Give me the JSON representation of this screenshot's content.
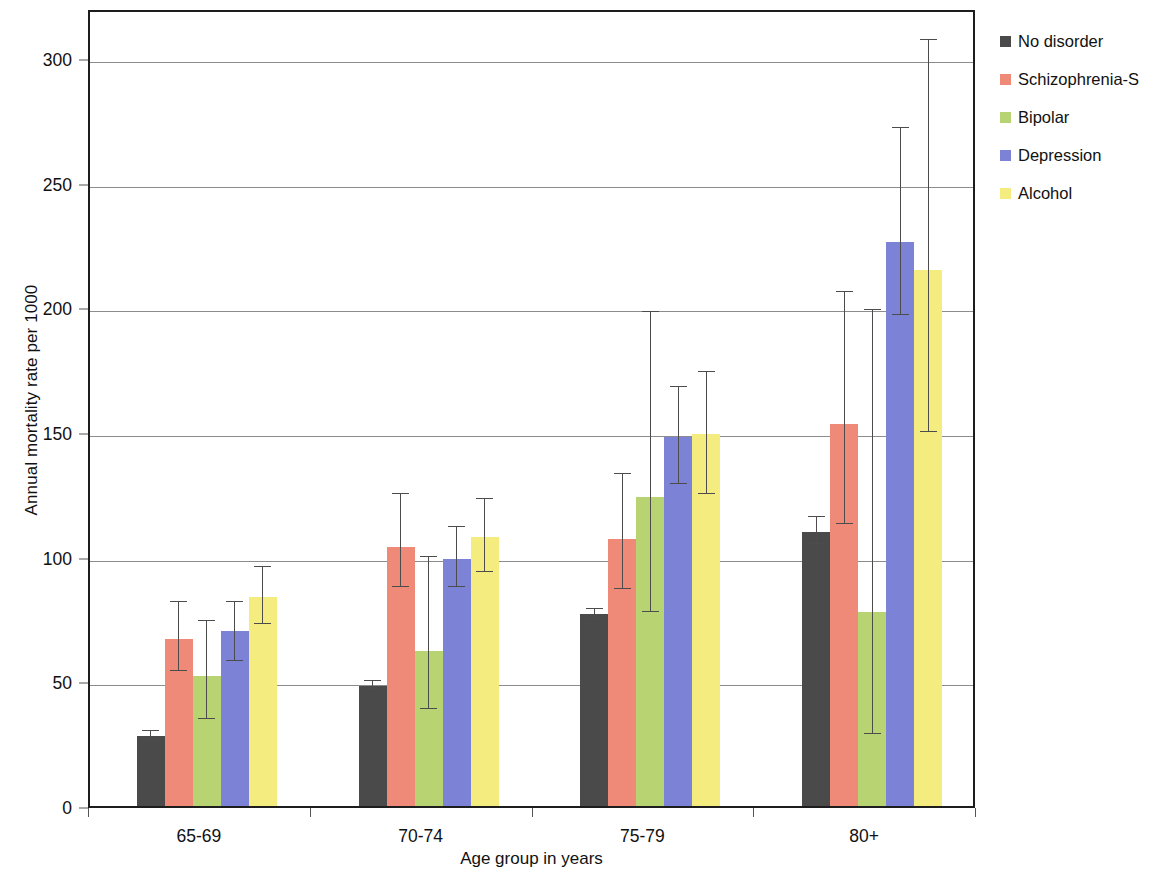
{
  "chart_data": {
    "type": "bar",
    "title": "",
    "subtitle": "",
    "xlabel": "Age group in years",
    "ylabel": "Annual mortality rate per 1000",
    "categories": [
      "65-69",
      "70-74",
      "75-79",
      "80+"
    ],
    "ylim": [
      0,
      320
    ],
    "yticks": [
      0,
      50,
      100,
      150,
      200,
      250,
      300
    ],
    "ytick_labels": [
      "0",
      "50",
      "100",
      "150",
      "200",
      "250",
      "300"
    ],
    "grid": "horizontal",
    "legend_position": "right",
    "error_bars": "95% confidence interval",
    "series": [
      {
        "name": "No disorder",
        "color": "#4a4a4a",
        "values": [
          28,
          48,
          77,
          110
        ],
        "err_low": [
          26,
          47,
          75,
          105
        ],
        "err_high": [
          30,
          50,
          79,
          116
        ]
      },
      {
        "name": "Schizophrenia-S",
        "color": "#f08a78",
        "values": [
          67,
          104,
          107,
          153
        ],
        "err_low": [
          54,
          88,
          87,
          113
        ],
        "err_high": [
          82,
          125,
          133,
          206
        ]
      },
      {
        "name": "Bipolar",
        "color": "#b8d472",
        "values": [
          52,
          62,
          124,
          78
        ],
        "err_low": [
          35,
          39,
          78,
          29
        ],
        "err_high": [
          74,
          100,
          198,
          199
        ]
      },
      {
        "name": "Depression",
        "color": "#7c82d6",
        "values": [
          70,
          99,
          148,
          226
        ],
        "err_low": [
          58,
          88,
          129,
          197
        ],
        "err_high": [
          82,
          112,
          168,
          272
        ]
      },
      {
        "name": "Alcohol",
        "color": "#f4ec7e",
        "values": [
          84,
          108,
          149,
          215
        ],
        "err_low": [
          73,
          94,
          125,
          150
        ],
        "err_high": [
          96,
          123,
          174,
          307
        ]
      }
    ]
  },
  "legend": {
    "items": [
      {
        "label": "No disorder",
        "color": "#4a4a4a"
      },
      {
        "label": "Schizophrenia-S",
        "color": "#f08a78"
      },
      {
        "label": "Bipolar",
        "color": "#b8d472"
      },
      {
        "label": "Depression",
        "color": "#7c82d6"
      },
      {
        "label": "Alcohol",
        "color": "#f4ec7e"
      }
    ]
  }
}
